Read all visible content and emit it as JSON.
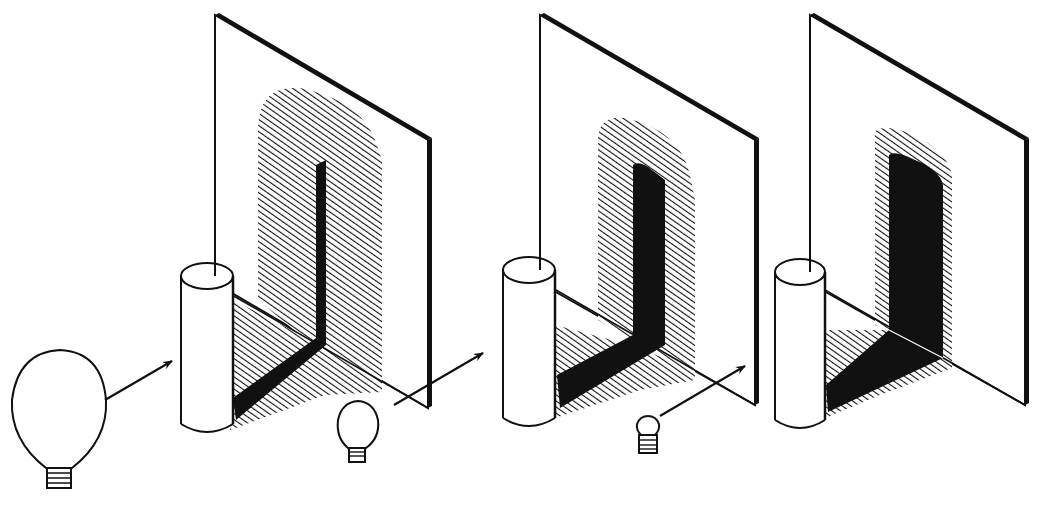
{
  "figure": {
    "type": "line-art illustration",
    "panels": [
      {
        "id": "panel-1",
        "light_source": "large globe bulb",
        "penumbra": "wide hatched",
        "umbra": "thin black strip"
      },
      {
        "id": "panel-2",
        "light_source": "medium bulb",
        "penumbra": "medium hatched",
        "umbra": "wider black strip"
      },
      {
        "id": "panel-3",
        "light_source": "tiny bulb",
        "penumbra": "narrow hatched fringe",
        "umbra": "large black"
      }
    ],
    "colors": {
      "ink": "#111111",
      "paper": "#ffffff"
    }
  }
}
